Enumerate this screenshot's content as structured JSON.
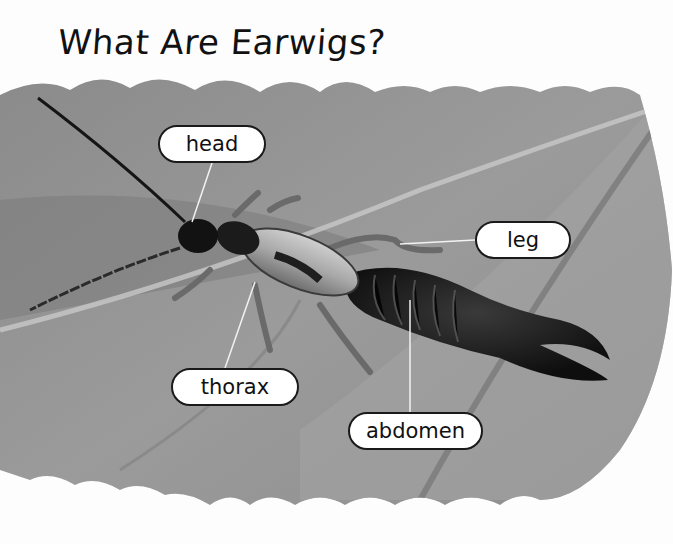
{
  "page": {
    "title": "What Are Earwigs?",
    "image_description": "Black-and-white photo of an earwig on a leaf"
  },
  "labels": {
    "head": "head",
    "leg": "leg",
    "thorax": "thorax",
    "abdomen": "abdomen"
  },
  "colors": {
    "background": "#ffffff",
    "leaf": "#8f8f8f",
    "insect": "#1a1a1a",
    "label_border": "#1a1a1a"
  }
}
